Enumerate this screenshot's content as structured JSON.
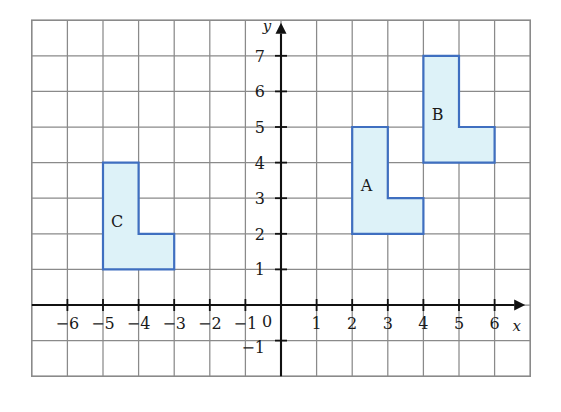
{
  "figure": {
    "title": "",
    "background_color": "#ffffff"
  },
  "chart_data": {
    "type": "scatter",
    "title": "",
    "xlabel": "x",
    "ylabel": "y",
    "grid": true,
    "legend": "none",
    "xlim": [
      -7,
      7
    ],
    "ylim": [
      -2,
      8
    ],
    "x_ticks": [
      -6,
      -5,
      -4,
      -3,
      -2,
      -1,
      1,
      2,
      3,
      4,
      5,
      6
    ],
    "x_tick_labels": [
      "−6",
      "−5",
      "−4",
      "−3",
      "−2",
      "−1",
      "1",
      "2",
      "3",
      "4",
      "5",
      "6"
    ],
    "y_ticks": [
      -1,
      1,
      2,
      3,
      4,
      5,
      6,
      7
    ],
    "y_tick_labels": [
      "−1",
      "1",
      "2",
      "3",
      "4",
      "5",
      "6",
      "7"
    ],
    "origin_label": "0",
    "grid_spacing_units": 1,
    "grid_extent": {
      "x_min": -7,
      "x_max": 7,
      "y_min": -2,
      "y_max": 8
    },
    "shapes": [
      {
        "name": "A",
        "label": "A",
        "type": "L-pentomino",
        "label_position": [
          2.4,
          3.2
        ],
        "vertices": [
          [
            2,
            5
          ],
          [
            3,
            5
          ],
          [
            3,
            3
          ],
          [
            4,
            3
          ],
          [
            4,
            2
          ],
          [
            2,
            2
          ]
        ],
        "fill": "#ddf2f8",
        "stroke": "#3f6fc0"
      },
      {
        "name": "B",
        "label": "B",
        "type": "L-pentomino",
        "label_position": [
          4.4,
          5.2
        ],
        "vertices": [
          [
            4,
            7
          ],
          [
            5,
            7
          ],
          [
            5,
            5
          ],
          [
            6,
            5
          ],
          [
            6,
            4
          ],
          [
            4,
            4
          ]
        ],
        "fill": "#ddf2f8",
        "stroke": "#3f6fc0"
      },
      {
        "name": "C",
        "label": "C",
        "type": "L-pentomino",
        "label_position": [
          -4.6,
          2.2
        ],
        "vertices": [
          [
            -5,
            4
          ],
          [
            -4,
            4
          ],
          [
            -4,
            2
          ],
          [
            -3,
            2
          ],
          [
            -3,
            1
          ],
          [
            -5,
            1
          ]
        ],
        "fill": "#ddf2f8",
        "stroke": "#3f6fc0"
      }
    ],
    "colors": {
      "shape_fill": "#ddf2f8",
      "shape_stroke": "#3f6fc0",
      "grid_line": "#8a8a8a",
      "grid_line_light": "#c3cdd6",
      "axis_line": "#111111",
      "text": "#1a1a1a"
    }
  }
}
